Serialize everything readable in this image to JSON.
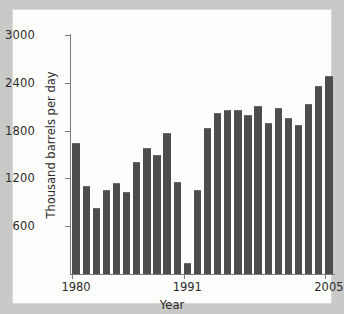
{
  "chart_data": {
    "type": "bar",
    "title": "",
    "xlabel": "Year",
    "ylabel": "Thousand barrels per day",
    "categories": [
      "1980",
      "1981",
      "1982",
      "1983",
      "1984",
      "1985",
      "1986",
      "1987",
      "1988",
      "1989",
      "1990",
      "1991",
      "1992",
      "1993",
      "1994",
      "1995",
      "1996",
      "1997",
      "1998",
      "1999",
      "2000",
      "2001",
      "2002",
      "2003",
      "2004",
      "2005"
    ],
    "values": [
      1650,
      1110,
      830,
      1050,
      1140,
      1030,
      1400,
      1580,
      1490,
      1770,
      1160,
      140,
      1060,
      1830,
      2020,
      2060,
      2060,
      1990,
      2110,
      1890,
      2090,
      1960,
      1870,
      2140,
      2360,
      2490
    ],
    "ylim": [
      0,
      3000
    ],
    "yticks": [
      600,
      1200,
      1800,
      2400,
      3000
    ],
    "ytick_labels": [
      "600",
      "1200",
      "1800",
      "2400",
      "3000"
    ],
    "xticks_labeled": [
      {
        "category": "1980",
        "label": "1980"
      },
      {
        "category": "1991",
        "label": "1991"
      },
      {
        "category": "2005",
        "label": "2005"
      }
    ],
    "grid": false,
    "legend": null,
    "bar_color": "#4d4d4d",
    "axis_color": "#7b7b79",
    "plot_background": "#fdfdfb",
    "page_background": "#c9c9c7"
  }
}
